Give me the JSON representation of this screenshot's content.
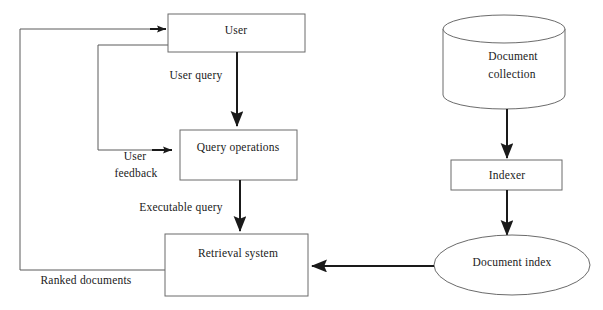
{
  "diagram": {
    "background_color": "#ffffff",
    "node_stroke_color": "#6b6b6b",
    "arrow_color": "#1a1a1a",
    "loop_color": "#5a5a5a",
    "text_color": "#1a1a1a",
    "nodes": [
      {
        "id": "user",
        "label": "User",
        "shape": "rectangle"
      },
      {
        "id": "query_operations",
        "label": "Query operations",
        "shape": "rectangle"
      },
      {
        "id": "retrieval_system",
        "label": "Retrieval system",
        "shape": "rectangle"
      },
      {
        "id": "document_collection",
        "label_line1": "Document",
        "label_line2": "collection",
        "shape": "cylinder"
      },
      {
        "id": "indexer",
        "label": "Indexer",
        "shape": "rectangle"
      },
      {
        "id": "document_index",
        "label": "Document index",
        "shape": "ellipse"
      }
    ],
    "edges": [
      {
        "id": "user-to-query-operations",
        "label": "User query",
        "from": "user",
        "to": "query_operations"
      },
      {
        "id": "query-operations-to-retrieval-system",
        "label": "Executable query",
        "from": "query_operations",
        "to": "retrieval_system"
      },
      {
        "id": "retrieval-system-to-user",
        "label": "Ranked documents",
        "from": "retrieval_system",
        "to": "user"
      },
      {
        "id": "user-to-query-operations-feedback",
        "label_line1": "User",
        "label_line2": "feedback",
        "from": "user",
        "to": "query_operations"
      },
      {
        "id": "document-collection-to-indexer",
        "label": "",
        "from": "document_collection",
        "to": "indexer"
      },
      {
        "id": "indexer-to-document-index",
        "label": "",
        "from": "indexer",
        "to": "document_index"
      },
      {
        "id": "document-index-to-retrieval-system",
        "label": "",
        "from": "document_index",
        "to": "retrieval_system"
      }
    ]
  }
}
